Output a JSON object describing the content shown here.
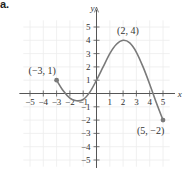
{
  "panel_label": "a.",
  "chart_data": {
    "type": "line",
    "title": "",
    "xlabel": "x",
    "ylabel": "y",
    "xlim": [
      -5.5,
      5.5
    ],
    "ylim": [
      -5.5,
      5.5
    ],
    "grid": true,
    "x_ticks": [
      -5,
      -4,
      -3,
      -2,
      -1,
      1,
      2,
      3,
      4,
      5
    ],
    "y_ticks": [
      -5,
      -4,
      -3,
      -2,
      -1,
      1,
      2,
      3,
      4,
      5
    ],
    "x_tick_labels": [
      "−5",
      "−4",
      "−3",
      "−2",
      "−1",
      "1",
      "2",
      "3",
      "4",
      "5"
    ],
    "y_tick_labels": [
      "−5",
      "−4",
      "−3",
      "−2",
      "−1",
      "1",
      "2",
      "3",
      "4",
      "5"
    ],
    "curve_color": "#7a7a7a",
    "series": [
      {
        "name": "f",
        "x": [
          -3,
          -2.5,
          -2,
          -1.5,
          -1,
          -0.5,
          0,
          0.5,
          1,
          1.5,
          2,
          2.5,
          3,
          3.5,
          4,
          4.5,
          5
        ],
        "y": [
          1,
          0.2,
          -0.35,
          -0.55,
          -0.45,
          0.1,
          1,
          2,
          3,
          3.7,
          4,
          3.8,
          3.1,
          2,
          0.7,
          -0.7,
          -2
        ]
      }
    ],
    "annotations": [
      {
        "text": "(−3, 1)",
        "x": -3,
        "y": 1,
        "endpoint": "closed"
      },
      {
        "text": "(2, 4)",
        "x": 2,
        "y": 4
      },
      {
        "text": "(5, −2)",
        "x": 5,
        "y": -2,
        "endpoint": "closed"
      }
    ]
  }
}
